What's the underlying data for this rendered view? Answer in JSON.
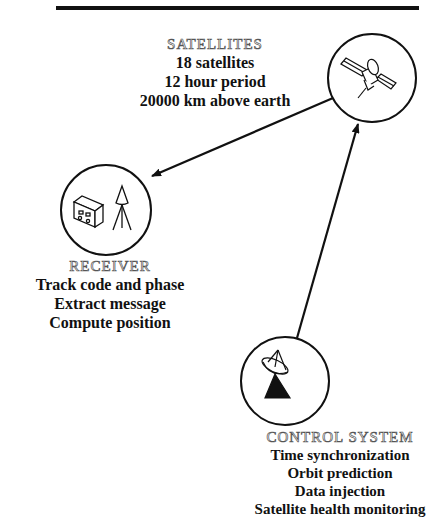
{
  "title_rule": true,
  "satellites": {
    "heading": "SATELLITES",
    "lines": [
      "18 satellites",
      "12 hour period",
      "20000 km above earth"
    ],
    "icon": "satellite-icon"
  },
  "receiver": {
    "heading": "RECEIVER",
    "lines": [
      "Track code and phase",
      "Extract message",
      "Compute position"
    ],
    "icon": "receiver-antenna-icon"
  },
  "control_system": {
    "heading": "CONTROL SYSTEM",
    "lines": [
      "Time synchronization",
      "Orbit prediction",
      "Data injection",
      "Satellite health monitoring"
    ],
    "icon": "dish-antenna-icon"
  },
  "arrows": [
    {
      "from": "satellites",
      "to": "receiver"
    },
    {
      "from": "control_system",
      "to": "satellites"
    }
  ],
  "colors": {
    "line": "#111111",
    "heading_outline": "#555555",
    "background": "#ffffff"
  }
}
